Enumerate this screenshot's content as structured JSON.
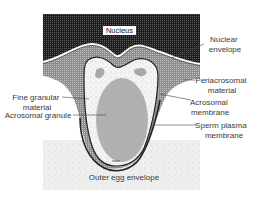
{
  "figure": {
    "labels": {
      "nucleus": "Nucleus",
      "nuclear_envelope": [
        "Nuclear",
        "envelope"
      ],
      "periacrosomal_material": [
        "Periacrosomal",
        "material"
      ],
      "fine_granular_material": [
        "Fine granular",
        "material"
      ],
      "acrosomal_membrane": [
        "Acrosomal",
        "membrane"
      ],
      "acrosomal_granule": "Acrosomal granule",
      "sperm_plasma_membrane": [
        "Sperm plasma",
        "membrane"
      ],
      "outer_egg_envelope": "Outer egg envelope"
    },
    "colors": {
      "nucleus_fill": "#2b2b2b",
      "periacrosomal_fill": "#9a9a9a",
      "vesicle_fill": "#f2f2f2",
      "granule_fill": "#b4b4b4",
      "egg_envelope_fill": "#ececec",
      "membrane_stroke": "#222222",
      "leader_line": "#444444"
    }
  }
}
